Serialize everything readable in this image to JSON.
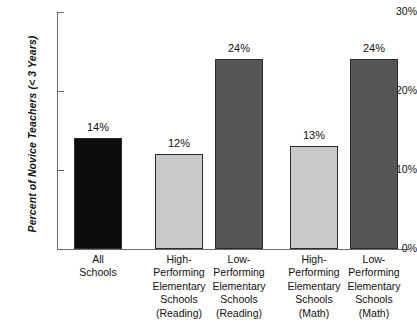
{
  "chart_data": {
    "type": "bar",
    "title": "",
    "xlabel": "",
    "ylabel": "Percent of Novice Teachers (< 3 Years)",
    "ylim": [
      0,
      30
    ],
    "yticks": [
      "0%",
      "10%",
      "20%",
      "30%"
    ],
    "ytick_values": [
      0,
      10,
      20,
      30
    ],
    "grid": false,
    "legend": "none",
    "categories": [
      "All Schools",
      "High-Performing Elementary Schools (Reading)",
      "Low-Performing Elementary Schools (Reading)",
      "High-Performing Elementary Schools (Math)",
      "Low-Performing Elementary Schools (Math)"
    ],
    "category_lines": [
      [
        "All",
        "Schools"
      ],
      [
        "High-",
        "Performing",
        "Elementary",
        "Schools",
        "(Reading)"
      ],
      [
        "Low-",
        "Performing",
        "Elementary",
        "Schools",
        "(Reading)"
      ],
      [
        "High-",
        "Performing",
        "Elementary",
        "Schools",
        "(Math)"
      ],
      [
        "Low-",
        "Performing",
        "Elementary",
        "Schools",
        "(Math)"
      ]
    ],
    "values": [
      14,
      12,
      24,
      13,
      24
    ],
    "value_labels": [
      "14%",
      "12%",
      "24%",
      "13%",
      "24%"
    ],
    "bar_colors": [
      "#0d0d0d",
      "#c9c9c9",
      "#565656",
      "#c9c9c9",
      "#565656"
    ]
  },
  "colors": {
    "black_bar": "#0d0d0d",
    "light_gray_bar": "#c9c9c9",
    "dark_gray_bar": "#565656",
    "axis": "#6b6b6b",
    "text": "#111111",
    "background": "#ffffff"
  }
}
